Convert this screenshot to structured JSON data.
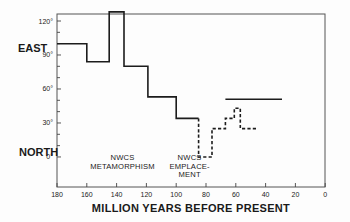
{
  "chart_data": {
    "type": "line",
    "title": "",
    "xlabel": "MILLION YEARS BEFORE PRESENT",
    "ylabel_top": "EAST",
    "ylabel_bottom": "NORTH",
    "xlim": [
      180,
      0
    ],
    "ylim": [
      -26,
      128
    ],
    "grid": false,
    "legend": null,
    "x_ticks": [
      180,
      160,
      140,
      120,
      100,
      80,
      60,
      40,
      20,
      0
    ],
    "y_ticks_major": [
      {
        "value": 120,
        "label": "120°"
      },
      {
        "value": 90,
        "label": "90°"
      },
      {
        "value": 60,
        "label": "60°"
      },
      {
        "value": 30,
        "label": "30°"
      },
      {
        "value": 0,
        "label": "0°"
      }
    ],
    "y_ticks_minor": [
      110,
      100,
      80,
      70,
      50,
      40,
      20,
      10
    ],
    "series": [
      {
        "name": "step path (solid)",
        "style": "solid",
        "points": [
          [
            180,
            100
          ],
          [
            160,
            100
          ],
          [
            160,
            84
          ],
          [
            145,
            84
          ],
          [
            145,
            128
          ],
          [
            135,
            128
          ],
          [
            135,
            80
          ],
          [
            119,
            80
          ],
          [
            119,
            53
          ],
          [
            100,
            53
          ],
          [
            100,
            34
          ],
          [
            85,
            34
          ]
        ]
      },
      {
        "name": "step path (dashed)",
        "style": "dashed",
        "points": [
          [
            85,
            34
          ],
          [
            85,
            0
          ],
          [
            76,
            0
          ],
          [
            76,
            25
          ],
          [
            67,
            25
          ],
          [
            67,
            34
          ],
          [
            61,
            34
          ],
          [
            61,
            43
          ],
          [
            57,
            43
          ],
          [
            57,
            25
          ],
          [
            45,
            25
          ]
        ]
      },
      {
        "name": "horizontal reference line",
        "style": "solid",
        "points": [
          [
            67,
            51
          ],
          [
            29,
            51
          ]
        ]
      }
    ],
    "annotations": [
      {
        "lines": [
          "NWCS",
          "METAMORPHISM"
        ],
        "x": 136,
        "y": -3
      },
      {
        "lines": [
          "NWCS",
          "EMPLACE-",
          "MENT"
        ],
        "x": 91,
        "y": -3
      }
    ]
  }
}
